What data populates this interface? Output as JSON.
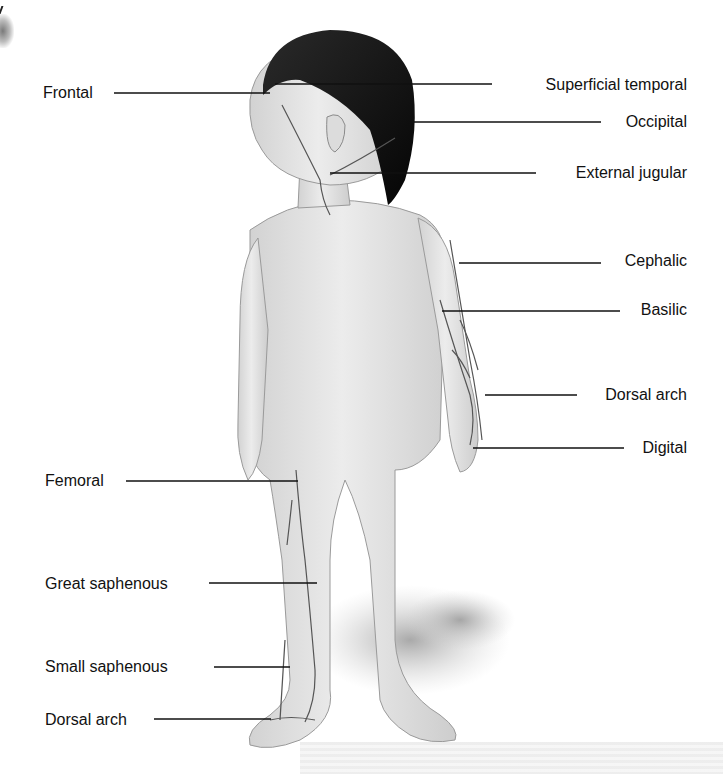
{
  "figure": {
    "labels_left": [
      {
        "text": "Frontal",
        "x": 43,
        "y": 84
      },
      {
        "text": "Femoral",
        "x": 45,
        "y": 472
      },
      {
        "text": "Great saphenous",
        "x": 45,
        "y": 575
      },
      {
        "text": "Small saphenous",
        "x": 45,
        "y": 658
      },
      {
        "text": "Dorsal arch",
        "x": 45,
        "y": 711
      }
    ],
    "labels_right": [
      {
        "text": "Superficial temporal",
        "right": 36,
        "y": 76
      },
      {
        "text": "Occipital",
        "right": 36,
        "y": 113
      },
      {
        "text": "External jugular",
        "right": 36,
        "y": 164
      },
      {
        "text": "Cephalic",
        "right": 36,
        "y": 252
      },
      {
        "text": "Basilic",
        "right": 36,
        "y": 301
      },
      {
        "text": "Dorsal arch",
        "right": 36,
        "y": 386
      },
      {
        "text": "Digital",
        "right": 36,
        "y": 439
      }
    ],
    "leader_lines": [
      {
        "x1": 114,
        "y1": 93,
        "x2": 270,
        "y2": 93
      },
      {
        "x1": 275,
        "y1": 84,
        "x2": 492,
        "y2": 84
      },
      {
        "x1": 410,
        "y1": 122,
        "x2": 601,
        "y2": 122
      },
      {
        "x1": 330,
        "y1": 173,
        "x2": 536,
        "y2": 173
      },
      {
        "x1": 459,
        "y1": 263,
        "x2": 601,
        "y2": 263
      },
      {
        "x1": 442,
        "y1": 311,
        "x2": 620,
        "y2": 311
      },
      {
        "x1": 485,
        "y1": 395,
        "x2": 577,
        "y2": 395
      },
      {
        "x1": 473,
        "y1": 448,
        "x2": 624,
        "y2": 448
      },
      {
        "x1": 126,
        "y1": 481,
        "x2": 298,
        "y2": 481
      },
      {
        "x1": 209,
        "y1": 583,
        "x2": 317,
        "y2": 583
      },
      {
        "x1": 214,
        "y1": 667,
        "x2": 290,
        "y2": 667
      },
      {
        "x1": 154,
        "y1": 719,
        "x2": 271,
        "y2": 719
      }
    ]
  },
  "colors": {
    "label_text": "#111111",
    "leader_line": "#111111",
    "skin": "#e6e6e6",
    "skin_shadow": "#c8c8c8",
    "hair": "#111111",
    "vein": "#5a5a5a",
    "floor_shadow": "#b5b5b5"
  }
}
